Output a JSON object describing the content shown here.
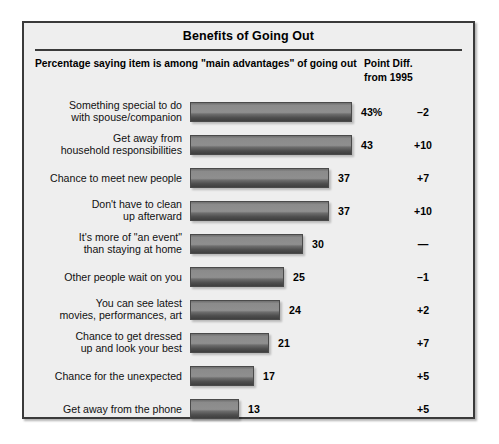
{
  "chart_title": "Benefits of Going Out",
  "subtitle": "Percentage saying item is among \"main advantages\" of going out",
  "diff_header_line1": "Point Diff.",
  "diff_header_line2": "from 1995",
  "chart_data": {
    "type": "bar",
    "title": "Benefits of Going Out",
    "subtitle": "Percentage saying item is among \"main advantages\" of going out",
    "orientation": "horizontal",
    "xlabel": "",
    "ylabel": "",
    "xlim": [
      0,
      43
    ],
    "grid": false,
    "legend": null,
    "value_suffix_first_row": "%",
    "categories": [
      "Something special to do with spouse/companion",
      "Get away from household responsibilities",
      "Chance to meet new people",
      "Don't have to clean up afterward",
      "It's more of \"an event\" than staying at home",
      "Other people wait on you",
      "You can see latest movies, performances, art",
      "Chance to get dressed up and look your best",
      "Chance for the unexpected",
      "Get away from the phone"
    ],
    "values": [
      43,
      43,
      37,
      37,
      30,
      25,
      24,
      21,
      17,
      13
    ],
    "value_labels": [
      "43%",
      "43",
      "37",
      "37",
      "30",
      "25",
      "24",
      "21",
      "17",
      "13"
    ],
    "series": [
      {
        "name": "Percentage saying item is among \"main advantages\" of going out",
        "values": [
          43,
          43,
          37,
          37,
          30,
          25,
          24,
          21,
          17,
          13
        ]
      },
      {
        "name": "Point Diff. from 1995",
        "values": [
          -2,
          10,
          7,
          10,
          null,
          -1,
          2,
          7,
          5,
          5
        ],
        "labels": [
          "–2",
          "+10",
          "+7",
          "+10",
          "—",
          "–1",
          "+2",
          "+7",
          "+5",
          "+5"
        ]
      }
    ]
  },
  "rows": [
    {
      "label": "Something special to do\nwith spouse/companion",
      "value": 43,
      "value_label": "43%",
      "diff": "–2"
    },
    {
      "label": "Get away from\nhousehold responsibilities",
      "value": 43,
      "value_label": "43",
      "diff": "+10"
    },
    {
      "label": "Chance to meet new people",
      "value": 37,
      "value_label": "37",
      "diff": "+7"
    },
    {
      "label": "Don't have to clean\nup afterward",
      "value": 37,
      "value_label": "37",
      "diff": "+10"
    },
    {
      "label": "It's more of \"an event\"\nthan staying at home",
      "value": 30,
      "value_label": "30",
      "diff": "—"
    },
    {
      "label": "Other people wait on you",
      "value": 25,
      "value_label": "25",
      "diff": "–1"
    },
    {
      "label": "You can see latest\nmovies, performances, art",
      "value": 24,
      "value_label": "24",
      "diff": "+2"
    },
    {
      "label": "Chance to get dressed\nup and look your best",
      "value": 21,
      "value_label": "21",
      "diff": "+7"
    },
    {
      "label": "Chance for the unexpected",
      "value": 17,
      "value_label": "17",
      "diff": "+5"
    },
    {
      "label": "Get away from the phone",
      "value": 13,
      "value_label": "13",
      "diff": "+5"
    }
  ],
  "colors": {
    "frame_border": "#3a3a3a",
    "panel_background": "#eeeeee",
    "bar_light": "#8f8f8f",
    "bar_dark": "#3f3f3f",
    "text": "#000000"
  }
}
